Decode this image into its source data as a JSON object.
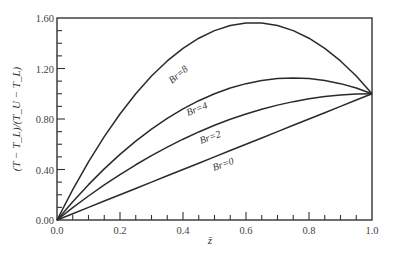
{
  "chart_data": {
    "type": "line",
    "title": "",
    "xlabel": "z̄",
    "ylabel": "(T − T_L)/(T_U − T_L)",
    "xlim": [
      0.0,
      1.0
    ],
    "ylim": [
      0.0,
      1.6
    ],
    "grid": false,
    "legend": "inline labels on curves",
    "x_ticks": [
      "0.0",
      "0.2",
      "0.4",
      "0.6",
      "0.8",
      "1.0"
    ],
    "y_ticks": [
      "0.00",
      "0.40",
      "0.80",
      "1.20",
      "1.60"
    ],
    "x": [
      0.0,
      0.05,
      0.1,
      0.15,
      0.2,
      0.25,
      0.3,
      0.35,
      0.4,
      0.45,
      0.5,
      0.55,
      0.6,
      0.65,
      0.7,
      0.75,
      0.8,
      0.85,
      0.9,
      0.95,
      1.0
    ],
    "series": [
      {
        "name": "Br=0",
        "label": "Br=0",
        "values": [
          0.0,
          0.05,
          0.1,
          0.15,
          0.2,
          0.25,
          0.3,
          0.35,
          0.4,
          0.45,
          0.5,
          0.55,
          0.6,
          0.65,
          0.7,
          0.75,
          0.8,
          0.85,
          0.9,
          0.95,
          1.0
        ]
      },
      {
        "name": "Br=2",
        "label": "Br=2",
        "values": [
          0.0,
          0.0975,
          0.19,
          0.2775,
          0.36,
          0.4375,
          0.51,
          0.5775,
          0.64,
          0.6975,
          0.75,
          0.7975,
          0.84,
          0.8775,
          0.91,
          0.9375,
          0.96,
          0.9775,
          0.99,
          0.9975,
          1.0
        ]
      },
      {
        "name": "Br=4",
        "label": "Br=4",
        "values": [
          0.0,
          0.145,
          0.28,
          0.405,
          0.52,
          0.625,
          0.72,
          0.805,
          0.88,
          0.945,
          1.0,
          1.045,
          1.08,
          1.105,
          1.12,
          1.125,
          1.12,
          1.105,
          1.08,
          1.045,
          1.0
        ]
      },
      {
        "name": "Br=8",
        "label": "Br=8",
        "values": [
          0.0,
          0.24,
          0.46,
          0.66,
          0.84,
          1.0,
          1.14,
          1.26,
          1.36,
          1.44,
          1.5,
          1.54,
          1.56,
          1.56,
          1.54,
          1.5,
          1.44,
          1.36,
          1.26,
          1.14,
          1.0
        ]
      }
    ]
  },
  "labels": {
    "br0": "Br=0",
    "br2": "Br=2",
    "br4": "Br=4",
    "br8": "Br=8",
    "xlabel": "z̄",
    "ylabel": "(T − T_L)/(T_U − T_L)"
  },
  "colors": {
    "line": "#2a2a2a",
    "axis": "#333333",
    "text": "#444444"
  }
}
